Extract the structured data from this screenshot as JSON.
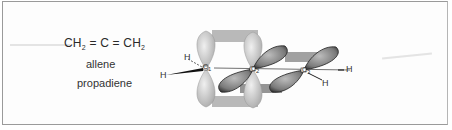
{
  "figure": {
    "formula": {
      "part1": "CH",
      "sub1": "2",
      "bond1": "=",
      "center": "C",
      "bond2": "=",
      "part2": "CH",
      "sub2": "2"
    },
    "common_name": "allene",
    "iupac_name": "propadiene",
    "atoms": {
      "h_top_left": "H",
      "h_left": "H",
      "c1": "C",
      "c1_sub": "1",
      "c2": "C",
      "c2_sub": "2",
      "c3": "C",
      "c3_sub": "3",
      "h_right": "H",
      "h_bottom_right": "H"
    },
    "colors": {
      "light_orbital": "#c8c8c8",
      "dark_orbital": "#6a6a6a",
      "overlap_band": "#9a9a9a",
      "border": "#9a9a9a"
    }
  }
}
